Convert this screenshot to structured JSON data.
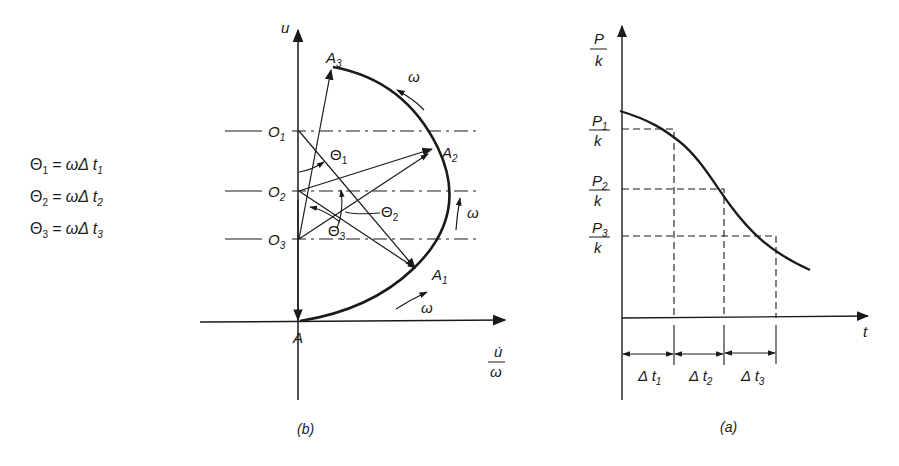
{
  "equations": {
    "eq1": {
      "lhs": "Θ",
      "lhs_sub": "1",
      "rhs": "= ωΔ t",
      "rhs_sub": "1"
    },
    "eq2": {
      "lhs": "Θ",
      "lhs_sub": "2",
      "rhs": "= ωΔ t",
      "rhs_sub": "2"
    },
    "eq3": {
      "lhs": "Θ",
      "lhs_sub": "3",
      "rhs": "= ωΔ t",
      "rhs_sub": "3"
    }
  },
  "diagram_b": {
    "caption": "(b)",
    "y_axis_label": "u",
    "x_axis_label_num": "u̇",
    "x_axis_label_den": "ω",
    "points": {
      "A": "A",
      "A1": {
        "base": "A",
        "sub": "1"
      },
      "A2": {
        "base": "A",
        "sub": "2"
      },
      "A3": {
        "base": "A",
        "sub": "3"
      },
      "O1": {
        "base": "O",
        "sub": "1"
      },
      "O2": {
        "base": "O",
        "sub": "2"
      },
      "O3": {
        "base": "O",
        "sub": "3"
      }
    },
    "angles": {
      "theta1": {
        "base": "Θ",
        "sub": "1"
      },
      "theta2": {
        "base": "Θ",
        "sub": "2"
      },
      "theta3": {
        "base": "Θ",
        "sub": "3"
      }
    },
    "omega": "ω"
  },
  "diagram_a": {
    "caption": "(a)",
    "y_axis_num": "P",
    "y_axis_den": "k",
    "x_axis_label": "t",
    "levels": [
      {
        "num": "P",
        "sub": "1",
        "den": "k"
      },
      {
        "num": "P",
        "sub": "2",
        "den": "k"
      },
      {
        "num": "P",
        "sub": "3",
        "den": "k"
      }
    ],
    "intervals": [
      {
        "label": "Δ t",
        "sub": "1"
      },
      {
        "label": "Δ t",
        "sub": "2"
      },
      {
        "label": "Δ t",
        "sub": "3"
      }
    ]
  },
  "colors": {
    "ink": "#1a1a1a",
    "background": "#ffffff"
  }
}
